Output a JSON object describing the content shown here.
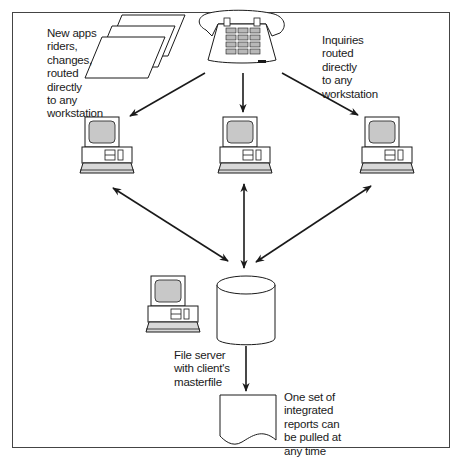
{
  "diagram": {
    "type": "network-workflow",
    "colors": {
      "line": "#1a1a1a",
      "screen_fill": "#c8c8c8",
      "keyboard_fill": "#d8d8d8",
      "frame": "#444444"
    },
    "nodes": {
      "documents": {
        "label": "New apps\nriders,\nchanges,\nrouted\ndirectly\nto any\nworkstation",
        "icon": "stacked-documents-icon"
      },
      "telephone": {
        "label": "",
        "icon": "telephone-icon"
      },
      "inquiries": {
        "label": "Inquiries\nrouted\ndirectly\nto any\nworkstation"
      },
      "workstations": [
        {
          "id": "workstation-left",
          "icon": "computer-icon"
        },
        {
          "id": "workstation-center",
          "icon": "computer-icon"
        },
        {
          "id": "workstation-right",
          "icon": "computer-icon"
        }
      ],
      "server_computer": {
        "icon": "computer-icon"
      },
      "database": {
        "icon": "database-cylinder-icon"
      },
      "file_server": {
        "label": "File server\nwith client's\nmasterfile"
      },
      "report": {
        "label": "One set of\nintegrated\nreports can\nbe pulled at\nany time",
        "icon": "report-document-icon"
      }
    },
    "edges": [
      {
        "from": "telephone",
        "to": "workstation-left",
        "direction": "one-way"
      },
      {
        "from": "telephone",
        "to": "workstation-center",
        "direction": "one-way"
      },
      {
        "from": "telephone",
        "to": "workstation-right",
        "direction": "one-way"
      },
      {
        "from": "workstation-left",
        "to": "database",
        "direction": "two-way"
      },
      {
        "from": "workstation-center",
        "to": "database",
        "direction": "two-way"
      },
      {
        "from": "workstation-right",
        "to": "database",
        "direction": "two-way"
      },
      {
        "from": "database",
        "to": "report",
        "direction": "one-way"
      }
    ]
  }
}
